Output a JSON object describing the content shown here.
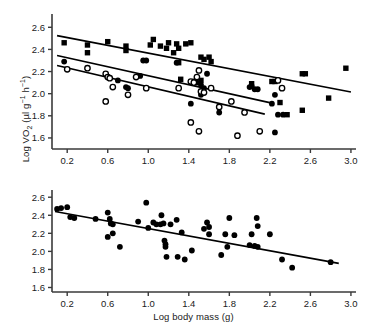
{
  "figure": {
    "ylabel": "Log VO",
    "ylabel_sub": "2",
    "ylabel_units_open": " (µl g",
    "ylabel_units_sup1": "−1",
    "ylabel_units_mid": " h",
    "ylabel_units_sup2": "−1",
    "ylabel_units_close": ")",
    "xlabel": "Log body mass (g)",
    "line_color": "#000000",
    "marker_color": "#000000",
    "axis_color": "#3a3a3a",
    "background": "#ffffff"
  },
  "chart_data": [
    {
      "type": "scatter",
      "panel": "top",
      "title": "",
      "xlabel": "",
      "ylabel": "Log VO2 (µl g−1 h−1)",
      "xlim": [
        0.05,
        3.05
      ],
      "ylim": [
        1.5,
        2.72
      ],
      "xticks": [
        0.2,
        0.6,
        1.0,
        1.4,
        1.8,
        2.2,
        2.6,
        3.0
      ],
      "xticklabels": [
        "0.2",
        "0.6",
        "1.0",
        "1.4",
        "1.8",
        "2.2",
        "2.6",
        "3.0"
      ],
      "yticks": [
        1.6,
        1.8,
        2.0,
        2.2,
        2.4,
        2.6
      ],
      "yticklabels": [
        "1.6",
        "1.8",
        "2.0",
        "2.2",
        "2.4",
        "2.6"
      ],
      "grid": false,
      "legend": "none",
      "series": [
        {
          "name": "filled-squares",
          "marker": "square",
          "fill": "#000000",
          "points": [
            [
              0.17,
              2.46
            ],
            [
              0.4,
              2.44
            ],
            [
              0.4,
              2.37
            ],
            [
              0.6,
              2.47
            ],
            [
              0.78,
              2.43
            ],
            [
              0.78,
              2.39
            ],
            [
              1.02,
              2.44
            ],
            [
              1.05,
              2.49
            ],
            [
              1.12,
              2.43
            ],
            [
              1.18,
              2.41
            ],
            [
              1.2,
              2.46
            ],
            [
              1.25,
              2.37
            ],
            [
              1.28,
              2.45
            ],
            [
              1.3,
              2.41
            ],
            [
              1.37,
              2.45
            ],
            [
              1.42,
              2.46
            ],
            [
              1.3,
              2.28
            ],
            [
              1.52,
              2.33
            ],
            [
              1.55,
              2.31
            ],
            [
              1.6,
              2.33
            ],
            [
              1.62,
              2.29
            ],
            [
              1.32,
              2.13
            ],
            [
              1.52,
              2.12
            ],
            [
              2.02,
              2.09
            ],
            [
              2.22,
              2.11
            ],
            [
              2.25,
              2.11
            ],
            [
              2.3,
              1.92
            ],
            [
              2.37,
              1.81
            ],
            [
              2.52,
              2.18
            ],
            [
              2.55,
              2.18
            ],
            [
              2.52,
              1.85
            ],
            [
              2.78,
              1.96
            ],
            [
              2.95,
              2.23
            ]
          ],
          "regression": {
            "x1": 0.1,
            "y1": 2.525,
            "x2": 3.0,
            "y2": 2.015
          }
        },
        {
          "name": "filled-circles",
          "marker": "circle",
          "fill": "#000000",
          "points": [
            [
              0.17,
              2.29
            ],
            [
              0.7,
              2.12
            ],
            [
              0.78,
              2.06
            ],
            [
              0.8,
              2.05
            ],
            [
              0.92,
              2.16
            ],
            [
              0.95,
              2.3
            ],
            [
              0.98,
              2.3
            ],
            [
              1.28,
              2.28
            ],
            [
              1.45,
              2.11
            ],
            [
              1.48,
              2.1
            ],
            [
              1.52,
              2.08
            ],
            [
              1.55,
              2.05
            ],
            [
              1.58,
              2.18
            ],
            [
              1.42,
              1.91
            ],
            [
              1.52,
              1.99
            ],
            [
              1.7,
              1.83
            ],
            [
              2.0,
              2.06
            ],
            [
              2.02,
              2.07
            ],
            [
              2.05,
              2.04
            ],
            [
              2.08,
              2.04
            ],
            [
              2.22,
              1.91
            ],
            [
              2.25,
              1.99
            ],
            [
              2.28,
              1.81
            ],
            [
              2.33,
              1.81
            ],
            [
              2.25,
              1.65
            ]
          ],
          "regression": {
            "x1": 0.1,
            "y1": 2.345,
            "x2": 2.22,
            "y2": 1.915
          }
        },
        {
          "name": "open-circles",
          "marker": "circle-open",
          "fill": "#ffffff",
          "points": [
            [
              0.2,
              2.22
            ],
            [
              0.4,
              2.23
            ],
            [
              0.58,
              2.18
            ],
            [
              0.6,
              2.15
            ],
            [
              0.62,
              2.14
            ],
            [
              0.65,
              2.06
            ],
            [
              0.58,
              1.93
            ],
            [
              0.8,
              1.99
            ],
            [
              0.88,
              2.15
            ],
            [
              0.98,
              2.05
            ],
            [
              1.3,
              2.05
            ],
            [
              1.42,
              2.11
            ],
            [
              1.45,
              2.1
            ],
            [
              1.48,
              2.15
            ],
            [
              1.5,
              2.21
            ],
            [
              1.52,
              2.02
            ],
            [
              1.55,
              2.01
            ],
            [
              1.62,
              2.05
            ],
            [
              1.42,
              1.74
            ],
            [
              1.5,
              1.66
            ],
            [
              1.7,
              1.88
            ],
            [
              1.82,
              1.93
            ],
            [
              1.88,
              1.62
            ],
            [
              1.95,
              1.83
            ],
            [
              2.1,
              1.66
            ],
            [
              2.28,
              2.12
            ],
            [
              2.32,
              2.05
            ]
          ],
          "regression": {
            "x1": 0.1,
            "y1": 2.255,
            "x2": 2.15,
            "y2": 1.815
          }
        }
      ]
    },
    {
      "type": "scatter",
      "panel": "bottom",
      "title": "",
      "xlabel": "Log body mass (g)",
      "ylabel": "Log VO2 (µl g−1 h−1)",
      "xlim": [
        0.05,
        3.05
      ],
      "ylim": [
        1.55,
        2.68
      ],
      "xticks": [
        0.2,
        0.6,
        1.0,
        1.4,
        1.8,
        2.2,
        2.6,
        3.0
      ],
      "xticklabels": [
        "0.2",
        "0.6",
        "1.0",
        "1.4",
        "1.8",
        "2.2",
        "2.6",
        "3.0"
      ],
      "yticks": [
        1.6,
        1.8,
        2.0,
        2.2,
        2.4,
        2.6
      ],
      "yticklabels": [
        "1.6",
        "1.8",
        "2.0",
        "2.2",
        "2.4",
        "2.6"
      ],
      "grid": false,
      "legend": "none",
      "series": [
        {
          "name": "filled-circles",
          "marker": "circle",
          "fill": "#000000",
          "points": [
            [
              0.1,
              2.47
            ],
            [
              0.14,
              2.48
            ],
            [
              0.2,
              2.49
            ],
            [
              0.23,
              2.38
            ],
            [
              0.27,
              2.37
            ],
            [
              0.48,
              2.36
            ],
            [
              0.6,
              2.43
            ],
            [
              0.6,
              2.16
            ],
            [
              0.62,
              2.36
            ],
            [
              0.63,
              2.31
            ],
            [
              0.65,
              2.3
            ],
            [
              0.65,
              2.2
            ],
            [
              0.72,
              2.05
            ],
            [
              0.9,
              2.33
            ],
            [
              0.98,
              2.54
            ],
            [
              1.0,
              2.26
            ],
            [
              1.05,
              2.32
            ],
            [
              1.08,
              2.3
            ],
            [
              1.12,
              2.3
            ],
            [
              1.13,
              2.4
            ],
            [
              1.15,
              2.31
            ],
            [
              1.16,
              2.12
            ],
            [
              1.17,
              2.08
            ],
            [
              1.17,
              2.05
            ],
            [
              1.18,
              1.94
            ],
            [
              1.22,
              2.3
            ],
            [
              1.28,
              2.35
            ],
            [
              1.29,
              1.94
            ],
            [
              1.33,
              2.21
            ],
            [
              1.36,
              1.91
            ],
            [
              1.43,
              2.01
            ],
            [
              1.55,
              2.25
            ],
            [
              1.58,
              2.32
            ],
            [
              1.6,
              2.27
            ],
            [
              1.6,
              2.19
            ],
            [
              1.72,
              1.96
            ],
            [
              1.76,
              2.19
            ],
            [
              1.78,
              2.05
            ],
            [
              1.8,
              2.37
            ],
            [
              1.85,
              2.18
            ],
            [
              2.0,
              2.07
            ],
            [
              2.02,
              2.19
            ],
            [
              2.05,
              2.06
            ],
            [
              2.07,
              2.37
            ],
            [
              2.08,
              2.28
            ],
            [
              2.08,
              2.05
            ],
            [
              2.2,
              2.19
            ],
            [
              2.32,
              1.91
            ],
            [
              2.42,
              1.82
            ],
            [
              2.8,
              1.88
            ]
          ],
          "regression": {
            "x1": 0.08,
            "y1": 2.442,
            "x2": 2.88,
            "y2": 1.868
          }
        }
      ]
    }
  ]
}
